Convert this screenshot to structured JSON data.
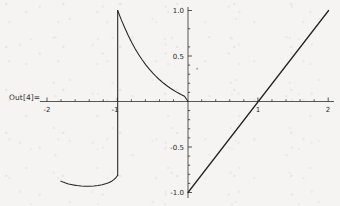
{
  "cell": {
    "out_label": "Out[4]="
  },
  "chart_data": {
    "type": "line",
    "title": "",
    "xlabel": "",
    "ylabel": "",
    "xlim": [
      -2.1,
      2.1
    ],
    "ylim": [
      -1.08,
      1.08
    ],
    "grid": false,
    "legend": "none",
    "axis_style": "mathematica-crossed-axes",
    "x_ticks_major": [
      -2,
      -1,
      1,
      2
    ],
    "x_tick_labels": [
      "-2",
      "-1",
      "1",
      "2"
    ],
    "y_ticks_major": [
      -1.0,
      -0.5,
      0.5,
      1.0
    ],
    "y_tick_labels": [
      "-1.0",
      "-0.5",
      "0.5",
      "1.0"
    ],
    "x_minor_tick_count_per_unit": 5,
    "y_minor_tick_count_per_half": 5,
    "series": [
      {
        "name": "decay-branch",
        "description": "exponential-like decay from (-1, 1.0) down to (0, 0)",
        "points": [
          [
            -1.0,
            1.0
          ],
          [
            -0.95,
            0.9
          ],
          [
            -0.9,
            0.81
          ],
          [
            -0.85,
            0.725
          ],
          [
            -0.8,
            0.648
          ],
          [
            -0.75,
            0.578
          ],
          [
            -0.7,
            0.514
          ],
          [
            -0.65,
            0.456
          ],
          [
            -0.6,
            0.403
          ],
          [
            -0.55,
            0.355
          ],
          [
            -0.5,
            0.312
          ],
          [
            -0.45,
            0.272
          ],
          [
            -0.4,
            0.236
          ],
          [
            -0.35,
            0.203
          ],
          [
            -0.3,
            0.173
          ],
          [
            -0.25,
            0.146
          ],
          [
            -0.2,
            0.121
          ],
          [
            -0.15,
            0.098
          ],
          [
            -0.1,
            0.077
          ],
          [
            -0.05,
            0.058
          ],
          [
            0.0,
            0.0
          ]
        ]
      },
      {
        "name": "vertical-jump",
        "description": "vertical segment at x = -1 from y = -0.81 to y = 1.0",
        "points": [
          [
            -1.0,
            -0.81
          ],
          [
            -1.0,
            1.0
          ]
        ]
      },
      {
        "name": "lower-u-branch",
        "description": "shallow U from (-1.81, -0.875) dipping to (-1.42, -0.932) rising to (-1.0, -0.81)",
        "points": [
          [
            -1.81,
            -0.875
          ],
          [
            -1.75,
            -0.894
          ],
          [
            -1.7,
            -0.906
          ],
          [
            -1.64,
            -0.916
          ],
          [
            -1.58,
            -0.924
          ],
          [
            -1.52,
            -0.929
          ],
          [
            -1.46,
            -0.932
          ],
          [
            -1.4,
            -0.932
          ],
          [
            -1.34,
            -0.929
          ],
          [
            -1.28,
            -0.924
          ],
          [
            -1.22,
            -0.915
          ],
          [
            -1.16,
            -0.902
          ],
          [
            -1.12,
            -0.89
          ],
          [
            -1.08,
            -0.873
          ],
          [
            -1.05,
            -0.856
          ],
          [
            -1.02,
            -0.833
          ],
          [
            -1.0,
            -0.81
          ]
        ]
      },
      {
        "name": "identity-line",
        "description": "straight line y = x from (0, -1.0) to (2, 1.0)",
        "points": [
          [
            0.0,
            -1.0
          ],
          [
            2.0,
            1.0
          ]
        ]
      }
    ],
    "annotations": [
      {
        "name": "speck",
        "x": 0.13,
        "y": 0.36,
        "kind": "dust-speck"
      }
    ]
  }
}
